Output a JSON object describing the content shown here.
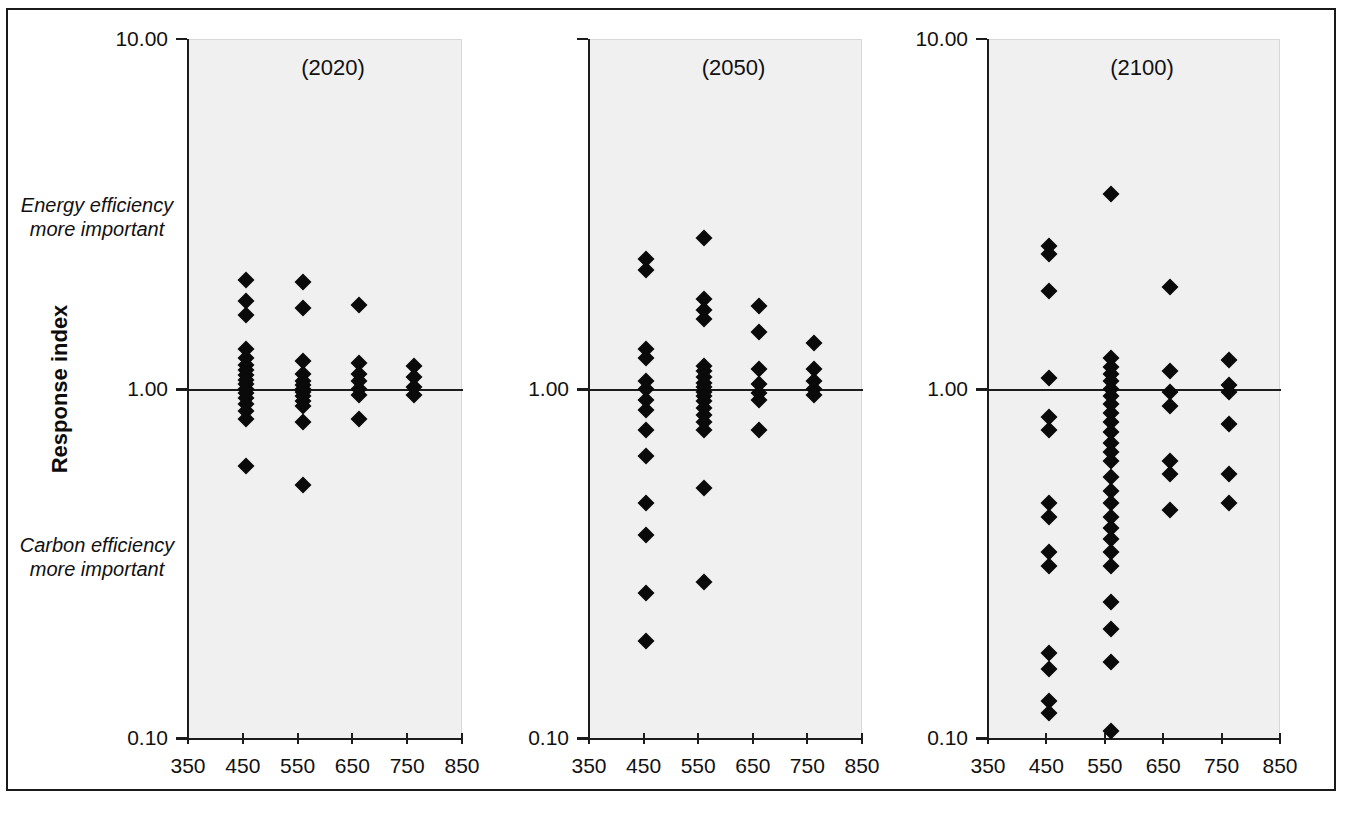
{
  "figure": {
    "background": "#ffffff",
    "plot_background": "#f0f0f0",
    "marker_color": "#0a0a0a",
    "axis_color": "#1c1c1c"
  },
  "axis": {
    "y_title": "Response index",
    "y_ticks": [
      "10.00",
      "1.00",
      "0.10"
    ],
    "x_ticks": [
      "350",
      "450",
      "550",
      "650",
      "750",
      "850"
    ],
    "annotation_top": "Energy efficiency\nmore important",
    "annotation_top_line1": "Energy efficiency",
    "annotation_top_line2": "more important",
    "annotation_bottom_line1": "Carbon efficiency",
    "annotation_bottom_line2": "more important"
  },
  "chart_data": {
    "type": "scatter",
    "title": "",
    "xlabel": "",
    "ylabel": "Response index",
    "yscale": "log",
    "ylim": [
      0.1,
      10.0
    ],
    "xlim": [
      350,
      850
    ],
    "yticks": [
      0.1,
      1.0,
      10.0
    ],
    "xticks": [
      350,
      450,
      550,
      650,
      750,
      850
    ],
    "grid": false,
    "legend": "none",
    "reference_line_y": 1.0,
    "annotations": [
      {
        "text": "Energy efficiency more important",
        "region": "above reference line"
      },
      {
        "text": "Carbon efficiency more important",
        "region": "below reference line"
      }
    ],
    "panels": [
      {
        "label": "(2020)",
        "points": [
          {
            "x": 455,
            "y": 2.05
          },
          {
            "x": 455,
            "y": 1.78
          },
          {
            "x": 455,
            "y": 1.62
          },
          {
            "x": 455,
            "y": 1.3
          },
          {
            "x": 455,
            "y": 1.22
          },
          {
            "x": 455,
            "y": 1.17
          },
          {
            "x": 455,
            "y": 1.13
          },
          {
            "x": 455,
            "y": 1.09
          },
          {
            "x": 455,
            "y": 1.06
          },
          {
            "x": 455,
            "y": 1.03
          },
          {
            "x": 455,
            "y": 1.0
          },
          {
            "x": 455,
            "y": 0.97
          },
          {
            "x": 455,
            "y": 0.94
          },
          {
            "x": 455,
            "y": 0.9
          },
          {
            "x": 455,
            "y": 0.86
          },
          {
            "x": 455,
            "y": 0.82
          },
          {
            "x": 455,
            "y": 0.6
          },
          {
            "x": 560,
            "y": 2.02
          },
          {
            "x": 560,
            "y": 1.7
          },
          {
            "x": 560,
            "y": 1.2
          },
          {
            "x": 560,
            "y": 1.1
          },
          {
            "x": 560,
            "y": 1.05
          },
          {
            "x": 560,
            "y": 1.02
          },
          {
            "x": 560,
            "y": 1.0
          },
          {
            "x": 560,
            "y": 0.98
          },
          {
            "x": 560,
            "y": 0.95
          },
          {
            "x": 560,
            "y": 0.92
          },
          {
            "x": 560,
            "y": 0.89
          },
          {
            "x": 560,
            "y": 0.8
          },
          {
            "x": 560,
            "y": 0.53
          },
          {
            "x": 662,
            "y": 1.73
          },
          {
            "x": 662,
            "y": 1.18
          },
          {
            "x": 662,
            "y": 1.1
          },
          {
            "x": 662,
            "y": 1.05
          },
          {
            "x": 662,
            "y": 1.0
          },
          {
            "x": 662,
            "y": 0.96
          },
          {
            "x": 662,
            "y": 0.82
          },
          {
            "x": 762,
            "y": 1.16
          },
          {
            "x": 762,
            "y": 1.08
          },
          {
            "x": 762,
            "y": 1.01
          },
          {
            "x": 762,
            "y": 0.96
          }
        ]
      },
      {
        "label": "(2050)",
        "points": [
          {
            "x": 455,
            "y": 2.35
          },
          {
            "x": 455,
            "y": 2.18
          },
          {
            "x": 455,
            "y": 1.3
          },
          {
            "x": 455,
            "y": 1.22
          },
          {
            "x": 455,
            "y": 1.05
          },
          {
            "x": 455,
            "y": 1.0
          },
          {
            "x": 455,
            "y": 0.93
          },
          {
            "x": 455,
            "y": 0.87
          },
          {
            "x": 455,
            "y": 0.76
          },
          {
            "x": 455,
            "y": 0.64
          },
          {
            "x": 455,
            "y": 0.47
          },
          {
            "x": 455,
            "y": 0.38
          },
          {
            "x": 455,
            "y": 0.26
          },
          {
            "x": 455,
            "y": 0.19
          },
          {
            "x": 560,
            "y": 2.7
          },
          {
            "x": 560,
            "y": 1.8
          },
          {
            "x": 560,
            "y": 1.68
          },
          {
            "x": 560,
            "y": 1.58
          },
          {
            "x": 560,
            "y": 1.16
          },
          {
            "x": 560,
            "y": 1.12
          },
          {
            "x": 560,
            "y": 1.08
          },
          {
            "x": 560,
            "y": 1.04
          },
          {
            "x": 560,
            "y": 1.01
          },
          {
            "x": 560,
            "y": 0.98
          },
          {
            "x": 560,
            "y": 0.95
          },
          {
            "x": 560,
            "y": 0.92
          },
          {
            "x": 560,
            "y": 0.88
          },
          {
            "x": 560,
            "y": 0.84
          },
          {
            "x": 560,
            "y": 0.8
          },
          {
            "x": 560,
            "y": 0.76
          },
          {
            "x": 560,
            "y": 0.52
          },
          {
            "x": 560,
            "y": 0.28
          },
          {
            "x": 662,
            "y": 1.72
          },
          {
            "x": 662,
            "y": 1.45
          },
          {
            "x": 662,
            "y": 1.14
          },
          {
            "x": 662,
            "y": 1.03
          },
          {
            "x": 662,
            "y": 0.97
          },
          {
            "x": 662,
            "y": 0.93
          },
          {
            "x": 662,
            "y": 0.76
          },
          {
            "x": 762,
            "y": 1.35
          },
          {
            "x": 762,
            "y": 1.14
          },
          {
            "x": 762,
            "y": 1.05
          },
          {
            "x": 762,
            "y": 1.0
          },
          {
            "x": 762,
            "y": 0.96
          }
        ]
      },
      {
        "label": "(2100)",
        "points": [
          {
            "x": 455,
            "y": 2.55
          },
          {
            "x": 455,
            "y": 2.42
          },
          {
            "x": 455,
            "y": 1.9
          },
          {
            "x": 455,
            "y": 1.07
          },
          {
            "x": 455,
            "y": 0.83
          },
          {
            "x": 455,
            "y": 0.76
          },
          {
            "x": 455,
            "y": 0.47
          },
          {
            "x": 455,
            "y": 0.43
          },
          {
            "x": 455,
            "y": 0.34
          },
          {
            "x": 455,
            "y": 0.31
          },
          {
            "x": 455,
            "y": 0.175
          },
          {
            "x": 455,
            "y": 0.158
          },
          {
            "x": 455,
            "y": 0.128
          },
          {
            "x": 455,
            "y": 0.118
          },
          {
            "x": 560,
            "y": 3.6
          },
          {
            "x": 560,
            "y": 1.22
          },
          {
            "x": 560,
            "y": 1.15
          },
          {
            "x": 560,
            "y": 1.1
          },
          {
            "x": 560,
            "y": 1.05
          },
          {
            "x": 560,
            "y": 1.0
          },
          {
            "x": 560,
            "y": 0.95
          },
          {
            "x": 560,
            "y": 0.9
          },
          {
            "x": 560,
            "y": 0.85
          },
          {
            "x": 560,
            "y": 0.8
          },
          {
            "x": 560,
            "y": 0.75
          },
          {
            "x": 560,
            "y": 0.7
          },
          {
            "x": 560,
            "y": 0.66
          },
          {
            "x": 560,
            "y": 0.62
          },
          {
            "x": 560,
            "y": 0.56
          },
          {
            "x": 560,
            "y": 0.51
          },
          {
            "x": 560,
            "y": 0.47
          },
          {
            "x": 560,
            "y": 0.43
          },
          {
            "x": 560,
            "y": 0.4
          },
          {
            "x": 560,
            "y": 0.37
          },
          {
            "x": 560,
            "y": 0.34
          },
          {
            "x": 560,
            "y": 0.31
          },
          {
            "x": 560,
            "y": 0.245
          },
          {
            "x": 560,
            "y": 0.205
          },
          {
            "x": 560,
            "y": 0.165
          },
          {
            "x": 560,
            "y": 0.105
          },
          {
            "x": 662,
            "y": 1.95
          },
          {
            "x": 662,
            "y": 1.12
          },
          {
            "x": 662,
            "y": 0.98
          },
          {
            "x": 662,
            "y": 0.89
          },
          {
            "x": 662,
            "y": 0.62
          },
          {
            "x": 662,
            "y": 0.57
          },
          {
            "x": 662,
            "y": 0.45
          },
          {
            "x": 762,
            "y": 1.21
          },
          {
            "x": 762,
            "y": 1.02
          },
          {
            "x": 762,
            "y": 0.98
          },
          {
            "x": 762,
            "y": 0.79
          },
          {
            "x": 762,
            "y": 0.57
          },
          {
            "x": 762,
            "y": 0.47
          }
        ]
      }
    ]
  }
}
